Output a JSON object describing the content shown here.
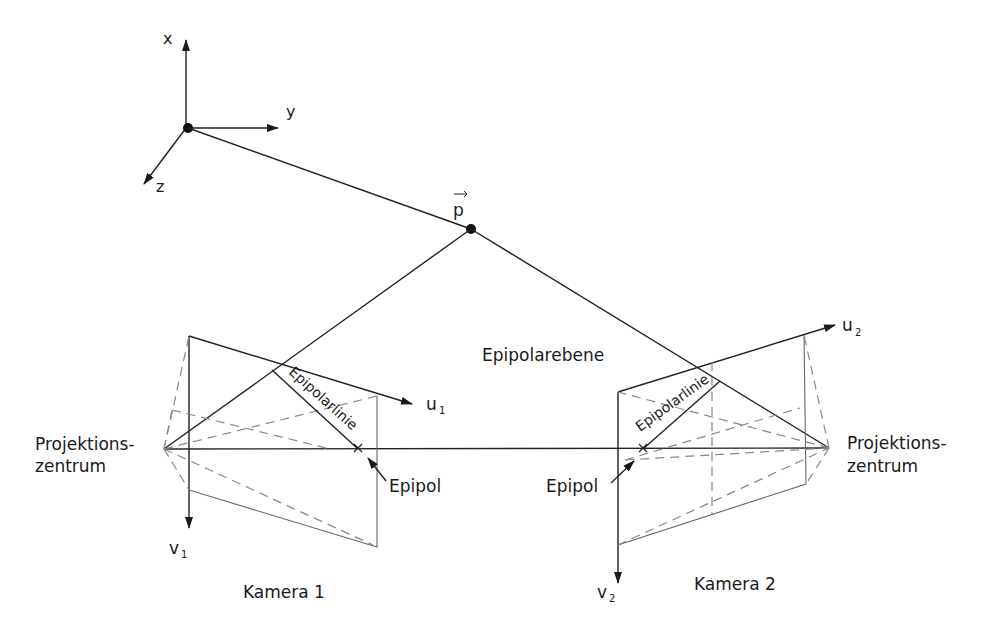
{
  "diagram": {
    "labels": {
      "axis_x": "x",
      "axis_y": "y",
      "axis_z": "z",
      "point": "p",
      "epipolar_plane": "Epipolarebene",
      "epipolar_line_1": "Epipolarlinie",
      "epipolar_line_2": "Epipolarlinie",
      "projection_center_left_l1": "Projektions-",
      "projection_center_left_l2": "zentrum",
      "projection_center_right_l1": "Projektions-",
      "projection_center_right_l2": "zentrum",
      "epipol_left": "Epipol",
      "epipol_right": "Epipol",
      "u1": "u",
      "u1_sub": "1",
      "v1": "v",
      "v1_sub": "1",
      "u2": "u",
      "u2_sub": "2",
      "v2": "v",
      "v2_sub": "2",
      "camera_1": "Kamera 1",
      "camera_2": "Kamera 2"
    },
    "colors": {
      "line": "#222222",
      "dashed": "#888888",
      "background": "#ffffff"
    }
  }
}
